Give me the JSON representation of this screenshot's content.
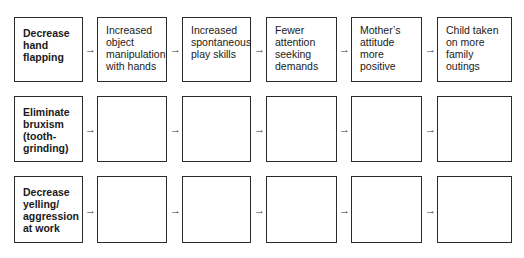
{
  "rows": [
    {
      "goal": "Decrease\nhand\nflapping",
      "steps": [
        "Increased\nobject\nmanipulation\nwith hands",
        "Increased\nspontaneous\nplay skills",
        "Fewer\nattention\nseeking\ndemands",
        "Mother’s\nattitude\nmore\npositive",
        "Child taken\non more\nfamily\noutings"
      ]
    },
    {
      "goal": "Eliminate\nbruxism\n(tooth-\ngrinding)",
      "steps": [
        "",
        "",
        "",
        "",
        ""
      ]
    },
    {
      "goal": "Decrease\nyelling/\naggression\nat work",
      "steps": [
        "",
        "",
        "",
        "",
        ""
      ]
    }
  ],
  "arrow_glyph": "→"
}
